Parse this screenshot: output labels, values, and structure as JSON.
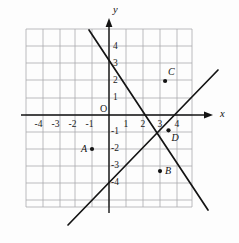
{
  "figure": {
    "kind": "coordinate-plane",
    "background_color": "#fdfdfd",
    "grid_color": "#a9a9ad",
    "axis_color": "#141414",
    "line_color": "#141414"
  },
  "axes": {
    "x_axis_name": "x",
    "y_axis_name": "y",
    "origin_label": "O",
    "x_ticks": [
      "-4",
      "-3",
      "-2",
      "-1",
      "1",
      "2",
      "3",
      "4"
    ],
    "y_ticks": [
      "4",
      "3",
      "2",
      "1",
      "-1",
      "-2",
      "-3",
      "-4"
    ]
  },
  "chart_data": {
    "type": "scatter",
    "title": "",
    "xlabel": "x",
    "ylabel": "y",
    "xlim": [
      -5,
      5.4
    ],
    "ylim": [
      -5.4,
      5
    ],
    "grid": true,
    "x_ticks": [
      -4,
      -3,
      -2,
      -1,
      1,
      2,
      3,
      4
    ],
    "y_ticks": [
      4,
      3,
      2,
      1,
      -1,
      -2,
      -3,
      -4
    ],
    "unit_px": 17,
    "origin_px": [
      109,
      115
    ],
    "points": [
      {
        "label": "A",
        "x": -1.0,
        "y": -2.0,
        "label_side": "left"
      },
      {
        "label": "B",
        "x": 3.0,
        "y": -3.3,
        "label_side": "right"
      },
      {
        "label": "C",
        "x": 3.3,
        "y": 2.0,
        "label_side": "upper-right"
      },
      {
        "label": "D",
        "x": 3.5,
        "y": -0.9,
        "label_side": "lower-right"
      }
    ],
    "lines": [
      {
        "name": "descending-line",
        "slope": -1.5,
        "intercept": 3,
        "px_start": [
          89,
          30
        ],
        "px_end": [
          208,
          210
        ]
      },
      {
        "name": "ascending-line",
        "slope": 1.0,
        "intercept": -3,
        "px_start": [
          68,
          225
        ],
        "px_end": [
          218,
          70
        ]
      }
    ],
    "gridlines_px": {
      "vertical_x": [
        26,
        43,
        60,
        75,
        92,
        109,
        126,
        143,
        160,
        177,
        192
      ],
      "horizontal_y": [
        29,
        46,
        63,
        80,
        98,
        115,
        132,
        149,
        166,
        183,
        200,
        207
      ]
    }
  }
}
